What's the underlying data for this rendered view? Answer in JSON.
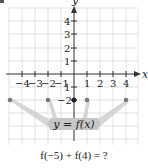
{
  "graph": {
    "axis_labels": {
      "x": "x",
      "y": "y"
    },
    "x_tick_labels": [
      "−4",
      "−3",
      "−2",
      "−1",
      "1",
      "2",
      "3",
      "4"
    ],
    "y_tick_labels": [
      "4",
      "3",
      "2",
      "1",
      "1",
      "−2"
    ],
    "function_label": "y = f(x)",
    "points": [
      {
        "x": -5,
        "y": -2
      },
      {
        "x": -2,
        "y": -2
      },
      {
        "x": 0,
        "y": -2
      },
      {
        "x": 1,
        "y": -2
      },
      {
        "x": 4,
        "y": -2
      }
    ],
    "colors": {
      "grid": "#d9d9d9",
      "axis": "#333333",
      "point": "#7a7a7a",
      "funnel": "#c9c9c9"
    }
  },
  "question": "f(−5) + f(4) = ?"
}
